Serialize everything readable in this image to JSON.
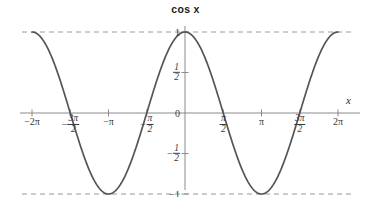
{
  "chart_data": {
    "type": "line",
    "title": "cos x",
    "xlabel": "x",
    "ylabel": "",
    "function": "y = cos(x)",
    "xlim": [
      -6.283185307179586,
      6.283185307179586
    ],
    "ylim": [
      -1.35,
      1.35
    ],
    "grid": false,
    "legend": null,
    "series": [
      {
        "name": "cos x",
        "color": "#555555",
        "x": [
          -6.283185307,
          -5.890486225,
          -5.497787144,
          -5.105088062,
          -4.71238898,
          -4.319689899,
          -3.926990817,
          -3.534291735,
          -3.141592654,
          -2.748893572,
          -2.35619449,
          -1.963495408,
          -1.570796327,
          -1.178097245,
          -0.785398163,
          -0.392699082,
          0.0,
          0.392699082,
          0.785398163,
          1.178097245,
          1.570796327,
          1.963495408,
          2.35619449,
          2.748893572,
          3.141592654,
          3.534291735,
          3.926990817,
          4.319689899,
          4.71238898,
          5.105088062,
          5.497787144,
          5.890486225,
          6.283185307
        ],
        "y": [
          1.0,
          0.9239,
          0.7071,
          0.3827,
          0.0,
          -0.3827,
          -0.7071,
          -0.9239,
          -1.0,
          -0.9239,
          -0.7071,
          -0.3827,
          0.0,
          0.3827,
          0.7071,
          0.9239,
          1.0,
          0.9239,
          0.7071,
          0.3827,
          0.0,
          -0.3827,
          -0.7071,
          -0.9239,
          -1.0,
          -0.9239,
          -0.7071,
          -0.3827,
          0.0,
          0.3827,
          0.7071,
          0.9239,
          1.0
        ]
      }
    ],
    "reference_lines": [
      {
        "name": "upper-bound",
        "y": 1,
        "style": "dashed",
        "color": "#9a9a9a"
      },
      {
        "name": "lower-bound",
        "y": -1,
        "style": "dashed",
        "color": "#9a9a9a"
      }
    ],
    "xticks": [
      {
        "value": -6.283185307,
        "label": "-2π",
        "kind": "plain"
      },
      {
        "value": -4.71238898,
        "label": "-3π/2",
        "kind": "fraction",
        "sign": "−",
        "num": "3π",
        "den": "2"
      },
      {
        "value": -3.141592654,
        "label": "-π",
        "kind": "plain"
      },
      {
        "value": -1.570796327,
        "label": "-π/2",
        "kind": "fraction",
        "sign": "−",
        "num": "π",
        "den": "2"
      },
      {
        "value": 1.570796327,
        "label": "π/2",
        "kind": "fraction",
        "sign": "",
        "num": "π",
        "den": "2"
      },
      {
        "value": 3.141592654,
        "label": "π",
        "kind": "plain"
      },
      {
        "value": 4.71238898,
        "label": "3π/2",
        "kind": "fraction",
        "sign": "",
        "num": "3π",
        "den": "2"
      },
      {
        "value": 6.283185307,
        "label": "2π",
        "kind": "plain"
      }
    ],
    "yticks": [
      {
        "value": 1,
        "label": "1",
        "kind": "plain"
      },
      {
        "value": 0.5,
        "label": "1/2",
        "kind": "fraction",
        "sign": "",
        "num": "1",
        "den": "2"
      },
      {
        "value": 0,
        "label": "0",
        "kind": "plain"
      },
      {
        "value": -0.5,
        "label": "-1/2",
        "kind": "fraction",
        "sign": "−",
        "num": "1",
        "den": "2"
      },
      {
        "value": -1,
        "label": "-1",
        "kind": "plain"
      }
    ]
  },
  "axis": {
    "x_axis_label": "x",
    "tick_marks_color": "#8a8a8a",
    "axis_color": "#8a8a8a"
  },
  "labels": {
    "x_neg2pi": "−2π",
    "x_neg3pi2_sign": "−",
    "x_neg3pi2_num": "3π",
    "x_neg3pi2_den": "2",
    "x_negpi": "−π",
    "x_negpi2_sign": "−",
    "x_negpi2_num": "π",
    "x_negpi2_den": "2",
    "x_pi2_num": "π",
    "x_pi2_den": "2",
    "x_pi": "π",
    "x_3pi2_num": "3π",
    "x_3pi2_den": "2",
    "x_2pi": "2π",
    "y_one": "1",
    "y_half_num": "1",
    "y_half_den": "2",
    "y_zero": "0",
    "y_neghalf_sign": "−",
    "y_neghalf_num": "1",
    "y_neghalf_den": "2",
    "y_negone": "−1"
  }
}
